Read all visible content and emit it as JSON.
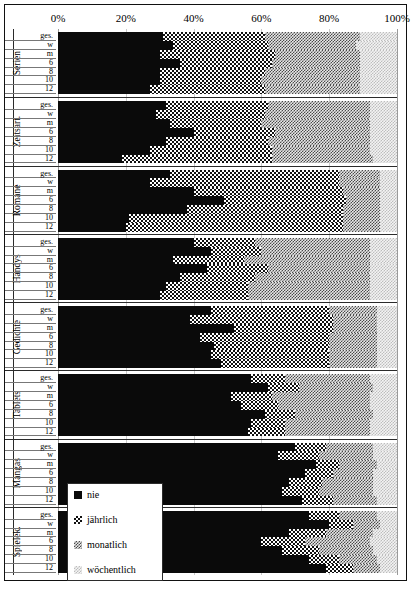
{
  "chart_data": {
    "type": "bar",
    "subtype": "stacked-horizontal-100pct",
    "title": "",
    "xlabel": "",
    "ylabel": "",
    "xlim": [
      0,
      100
    ],
    "xticks": [
      "0%",
      "20%",
      "40%",
      "60%",
      "80%",
      "100%"
    ],
    "xtick_values": [
      0,
      20,
      40,
      60,
      80,
      100
    ],
    "grid": true,
    "legend_position": "bottom-left-inside",
    "series": [
      {
        "name": "nie",
        "key": "nie",
        "pattern": "solid-black-dotted"
      },
      {
        "name": "jährlich",
        "key": "jaehrlich",
        "pattern": "checkerboard"
      },
      {
        "name": "monatlich",
        "key": "monatlich",
        "pattern": "dense-grey-checker"
      },
      {
        "name": "wöchentlich",
        "key": "woechentlich",
        "pattern": "light-grey-checker"
      }
    ],
    "row_labels": [
      "ges.",
      "w",
      "m",
      "6",
      "8",
      "10",
      "12"
    ],
    "groups": [
      {
        "category": "Serien",
        "rows": [
          {
            "label": "ges.",
            "values": [
              31,
              30,
              28,
              11
            ]
          },
          {
            "label": "w",
            "values": [
              34,
              28,
              26,
              12
            ]
          },
          {
            "label": "m",
            "values": [
              30,
              34,
              25,
              11
            ]
          },
          {
            "label": "6",
            "values": [
              36,
              27,
              26,
              11
            ]
          },
          {
            "label": "8",
            "values": [
              30,
              31,
              28,
              11
            ]
          },
          {
            "label": "10",
            "values": [
              30,
              30,
              29,
              11
            ]
          },
          {
            "label": "12",
            "values": [
              27,
              34,
              28,
              11
            ]
          }
        ]
      },
      {
        "category": "Zeitsart.",
        "rows": [
          {
            "label": "ges.",
            "values": [
              32,
              30,
              30,
              8
            ]
          },
          {
            "label": "w",
            "values": [
              29,
              32,
              31,
              8
            ]
          },
          {
            "label": "m",
            "values": [
              33,
              27,
              32,
              8
            ]
          },
          {
            "label": "6",
            "values": [
              40,
              24,
              28,
              8
            ]
          },
          {
            "label": "8",
            "values": [
              32,
              30,
              30,
              8
            ]
          },
          {
            "label": "10",
            "values": [
              27,
              36,
              29,
              8
            ]
          },
          {
            "label": "12",
            "values": [
              19,
              44,
              30,
              7
            ]
          }
        ]
      },
      {
        "category": "Romane",
        "rows": [
          {
            "label": "ges.",
            "values": [
              33,
              50,
              12,
              5
            ]
          },
          {
            "label": "w",
            "values": [
              27,
              56,
              12,
              5
            ]
          },
          {
            "label": "m",
            "values": [
              40,
              44,
              11,
              5
            ]
          },
          {
            "label": "6",
            "values": [
              49,
              36,
              10,
              5
            ]
          },
          {
            "label": "8",
            "values": [
              38,
              46,
              11,
              5
            ]
          },
          {
            "label": "10",
            "values": [
              21,
              63,
              11,
              5
            ]
          },
          {
            "label": "12",
            "values": [
              20,
              64,
              11,
              5
            ]
          }
        ]
      },
      {
        "category": "Handys",
        "rows": [
          {
            "label": "ges.",
            "values": [
              40,
              18,
              34,
              8
            ]
          },
          {
            "label": "w",
            "values": [
              45,
              15,
              32,
              8
            ]
          },
          {
            "label": "m",
            "values": [
              34,
              21,
              37,
              8
            ]
          },
          {
            "label": "6",
            "values": [
              44,
              18,
              30,
              8
            ]
          },
          {
            "label": "8",
            "values": [
              36,
              22,
              34,
              8
            ]
          },
          {
            "label": "10",
            "values": [
              32,
              24,
              36,
              8
            ]
          },
          {
            "label": "12",
            "values": [
              30,
              26,
              36,
              8
            ]
          }
        ]
      },
      {
        "category": "Gedichte",
        "rows": [
          {
            "label": "ges.",
            "values": [
              45,
              35,
              14,
              6
            ]
          },
          {
            "label": "w",
            "values": [
              39,
              42,
              13,
              6
            ]
          },
          {
            "label": "m",
            "values": [
              52,
              29,
              13,
              6
            ]
          },
          {
            "label": "6",
            "values": [
              42,
              38,
              14,
              6
            ]
          },
          {
            "label": "8",
            "values": [
              46,
              34,
              14,
              6
            ]
          },
          {
            "label": "10",
            "values": [
              45,
              35,
              14,
              6
            ]
          },
          {
            "label": "12",
            "values": [
              48,
              32,
              14,
              6
            ]
          }
        ]
      },
      {
        "category": "Tablets",
        "rows": [
          {
            "label": "ges.",
            "values": [
              57,
              10,
              25,
              8
            ]
          },
          {
            "label": "w",
            "values": [
              62,
              9,
              22,
              7
            ]
          },
          {
            "label": "m",
            "values": [
              51,
              12,
              29,
              8
            ]
          },
          {
            "label": "6",
            "values": [
              54,
              11,
              27,
              8
            ]
          },
          {
            "label": "8",
            "values": [
              61,
              9,
              23,
              7
            ]
          },
          {
            "label": "10",
            "values": [
              57,
              10,
              25,
              8
            ]
          },
          {
            "label": "12",
            "values": [
              56,
              11,
              25,
              8
            ]
          }
        ]
      },
      {
        "category": "Mangas",
        "rows": [
          {
            "label": "ges.",
            "values": [
              70,
              9,
              14,
              7
            ]
          },
          {
            "label": "w",
            "values": [
              65,
              12,
              16,
              7
            ]
          },
          {
            "label": "m",
            "values": [
              76,
              7,
              11,
              6
            ]
          },
          {
            "label": "6",
            "values": [
              73,
              8,
              12,
              7
            ]
          },
          {
            "label": "8",
            "values": [
              68,
              10,
              15,
              7
            ]
          },
          {
            "label": "10",
            "values": [
              66,
              11,
              16,
              7
            ]
          },
          {
            "label": "12",
            "values": [
              72,
              9,
              13,
              6
            ]
          }
        ]
      },
      {
        "category": "Spielek.",
        "rows": [
          {
            "label": "ges.",
            "values": [
              74,
              9,
              11,
              6
            ]
          },
          {
            "label": "w",
            "values": [
              80,
              7,
              8,
              5
            ]
          },
          {
            "label": "m",
            "values": [
              68,
              11,
              14,
              7
            ]
          },
          {
            "label": "6",
            "values": [
              60,
              13,
              19,
              8
            ]
          },
          {
            "label": "8",
            "values": [
              66,
              11,
              16,
              7
            ]
          },
          {
            "label": "10",
            "values": [
              74,
              9,
              11,
              6
            ]
          },
          {
            "label": "12",
            "values": [
              79,
              8,
              8,
              5
            ]
          }
        ]
      }
    ]
  },
  "legend": {
    "items": [
      {
        "label": "nie",
        "swatch": "legend-swatch-nie"
      },
      {
        "label": "jährlich",
        "swatch": "legend-swatch-jaehrlich"
      },
      {
        "label": "monatlich",
        "swatch": "legend-swatch-monatlich"
      },
      {
        "label": "wöchentlich",
        "swatch": "legend-swatch-woechentlich"
      }
    ]
  }
}
